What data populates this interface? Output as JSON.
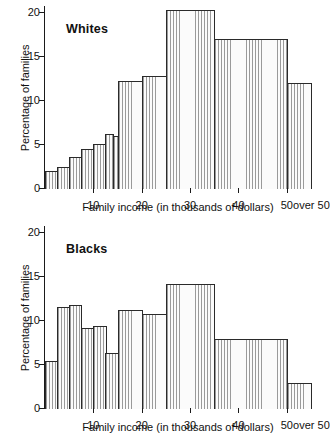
{
  "figure": {
    "kind": "two-panel-histogram",
    "background": "#ffffff",
    "ink_color": "#1a1a1a",
    "hatch_color": "#9a9a9a"
  },
  "panels": [
    {
      "id": "whites",
      "series_title": "Whites",
      "ylabel": "Percentage of families",
      "xlabel": "Family income (in thousands of dollars)",
      "y_ticks": [
        "0",
        "5",
        "10",
        "15",
        "20"
      ],
      "x_ticks": [
        "10",
        "20",
        "30",
        "40",
        "50"
      ],
      "x_over_label": "over 50"
    },
    {
      "id": "blacks",
      "series_title": "Blacks",
      "ylabel": "Percentage of families",
      "xlabel": "Family income (in thousands of dollars)",
      "y_ticks": [
        "0",
        "5",
        "10",
        "15",
        "20"
      ],
      "x_ticks": [
        "10",
        "20",
        "30",
        "40",
        "50"
      ],
      "x_over_label": "over 50"
    }
  ],
  "chart_data": [
    {
      "type": "bar",
      "title": "Whites",
      "xlabel": "Family income (in thousands of dollars)",
      "ylabel": "Percentage of families",
      "xlim": [
        0,
        55
      ],
      "ylim": [
        0,
        20
      ],
      "grid": false,
      "legend": "none",
      "x_tick_values": [
        10,
        20,
        30,
        40,
        50
      ],
      "x_tick_labels": [
        "10",
        "20",
        "30",
        "40",
        "50"
      ],
      "x_extra_label": "over 50",
      "y_tick_values": [
        0,
        5,
        10,
        15,
        20
      ],
      "y_tick_labels": [
        "0",
        "5",
        "10",
        "15",
        "20"
      ],
      "bins": [
        {
          "label": "0-2.5",
          "x0": 0,
          "x1": 2.5,
          "value": 2.0
        },
        {
          "label": "2.5-5",
          "x0": 2.5,
          "x1": 5,
          "value": 2.5
        },
        {
          "label": "5-7.5",
          "x0": 5,
          "x1": 7.5,
          "value": 3.6
        },
        {
          "label": "7.5-10",
          "x0": 7.5,
          "x1": 10,
          "value": 4.6
        },
        {
          "label": "10-12.5",
          "x0": 10,
          "x1": 12.5,
          "value": 5.1
        },
        {
          "label": "12.5-14",
          "x0": 12.5,
          "x1": 14,
          "value": 6.3
        },
        {
          "label": "14-15",
          "x0": 14,
          "x1": 15,
          "value": 6.0
        },
        {
          "label": "15-20",
          "x0": 15,
          "x1": 20,
          "value": 12.3
        },
        {
          "label": "20-25",
          "x0": 20,
          "x1": 25,
          "value": 12.8
        },
        {
          "label": "25-35",
          "x0": 25,
          "x1": 35,
          "value": 20.3
        },
        {
          "label": "35-50",
          "x0": 35,
          "x1": 50,
          "value": 17.0
        },
        {
          "label": "over 50",
          "x0": 50,
          "x1": 55,
          "value": 12.0
        }
      ]
    },
    {
      "type": "bar",
      "title": "Blacks",
      "xlabel": "Family income (in thousands of dollars)",
      "ylabel": "Percentage of families",
      "xlim": [
        0,
        55
      ],
      "ylim": [
        0,
        20
      ],
      "grid": false,
      "legend": "none",
      "x_tick_values": [
        10,
        20,
        30,
        40,
        50
      ],
      "x_tick_labels": [
        "10",
        "20",
        "30",
        "40",
        "50"
      ],
      "x_extra_label": "over 50",
      "y_tick_values": [
        0,
        5,
        10,
        15,
        20
      ],
      "y_tick_labels": [
        "0",
        "5",
        "10",
        "15",
        "20"
      ],
      "bins": [
        {
          "label": "0-2.5",
          "x0": 0,
          "x1": 2.5,
          "value": 5.5
        },
        {
          "label": "2.5-5",
          "x0": 2.5,
          "x1": 5,
          "value": 11.6
        },
        {
          "label": "5-7.5",
          "x0": 5,
          "x1": 7.5,
          "value": 11.8
        },
        {
          "label": "7.5-10",
          "x0": 7.5,
          "x1": 10,
          "value": 9.2
        },
        {
          "label": "10-12.5",
          "x0": 10,
          "x1": 12.5,
          "value": 9.4
        },
        {
          "label": "12.5-15",
          "x0": 12.5,
          "x1": 15,
          "value": 6.4
        },
        {
          "label": "15-20",
          "x0": 15,
          "x1": 20,
          "value": 11.2
        },
        {
          "label": "20-25",
          "x0": 20,
          "x1": 25,
          "value": 10.8
        },
        {
          "label": "25-35",
          "x0": 25,
          "x1": 35,
          "value": 14.2
        },
        {
          "label": "35-50",
          "x0": 35,
          "x1": 50,
          "value": 8.0
        },
        {
          "label": "over 50",
          "x0": 50,
          "x1": 55,
          "value": 2.9
        }
      ]
    }
  ]
}
